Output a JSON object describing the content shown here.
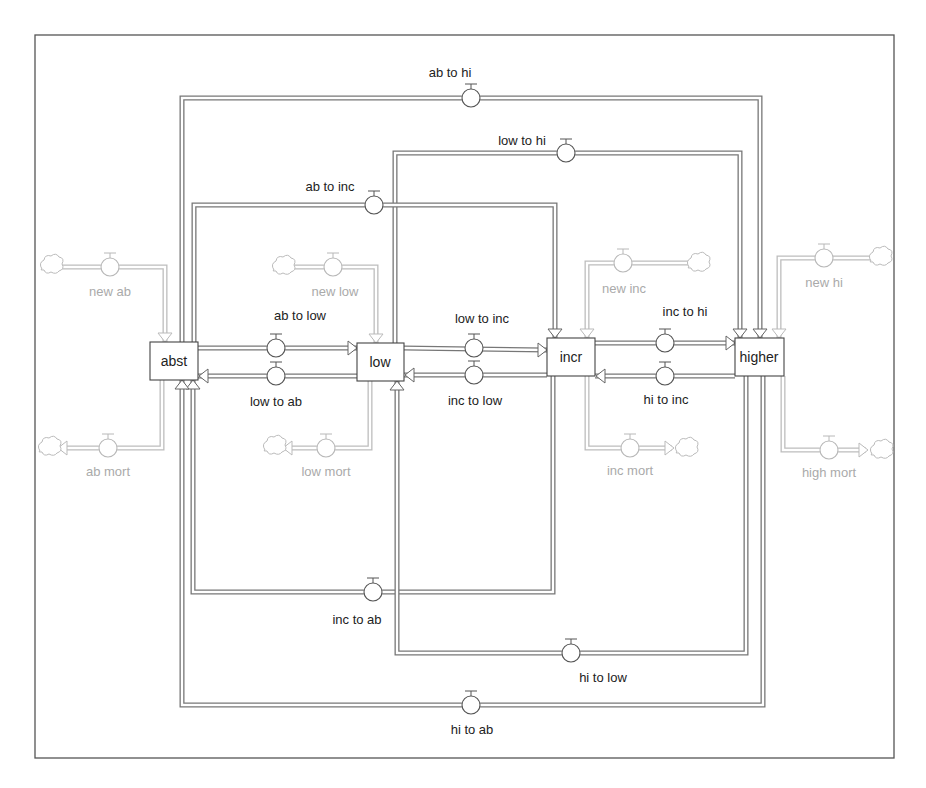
{
  "diagram": {
    "type": "stock-and-flow",
    "stocks": [
      {
        "id": "abst",
        "label": "abst"
      },
      {
        "id": "low",
        "label": "low"
      },
      {
        "id": "incr",
        "label": "incr"
      },
      {
        "id": "higher",
        "label": "higher"
      }
    ],
    "transfer_flows": [
      {
        "id": "ab_to_low",
        "label": "ab to low",
        "from": "abst",
        "to": "low"
      },
      {
        "id": "low_to_ab",
        "label": "low to ab",
        "from": "low",
        "to": "abst"
      },
      {
        "id": "low_to_inc",
        "label": "low to inc",
        "from": "low",
        "to": "incr"
      },
      {
        "id": "inc_to_low",
        "label": "inc to low",
        "from": "incr",
        "to": "low"
      },
      {
        "id": "inc_to_hi",
        "label": "inc to hi",
        "from": "incr",
        "to": "higher"
      },
      {
        "id": "hi_to_inc",
        "label": "hi to inc",
        "from": "higher",
        "to": "incr"
      },
      {
        "id": "ab_to_hi",
        "label": "ab to hi",
        "from": "abst",
        "to": "higher"
      },
      {
        "id": "low_to_hi",
        "label": "low to hi",
        "from": "low",
        "to": "higher"
      },
      {
        "id": "ab_to_inc",
        "label": "ab to inc",
        "from": "abst",
        "to": "incr"
      },
      {
        "id": "inc_to_ab",
        "label": "inc to ab",
        "from": "incr",
        "to": "abst"
      },
      {
        "id": "hi_to_low",
        "label": "hi to low",
        "from": "higher",
        "to": "low"
      },
      {
        "id": "hi_to_ab",
        "label": "hi to ab",
        "from": "higher",
        "to": "abst"
      }
    ],
    "external_flows": [
      {
        "id": "new_ab",
        "label": "new ab",
        "stock": "abst",
        "direction": "inflow"
      },
      {
        "id": "ab_mort",
        "label": "ab mort",
        "stock": "abst",
        "direction": "outflow"
      },
      {
        "id": "new_low",
        "label": "new low",
        "stock": "low",
        "direction": "inflow"
      },
      {
        "id": "low_mort",
        "label": "low mort",
        "stock": "low",
        "direction": "outflow"
      },
      {
        "id": "new_inc",
        "label": "new inc",
        "stock": "incr",
        "direction": "inflow"
      },
      {
        "id": "inc_mort",
        "label": "inc mort",
        "stock": "incr",
        "direction": "outflow"
      },
      {
        "id": "new_hi",
        "label": "new hi",
        "stock": "higher",
        "direction": "inflow"
      },
      {
        "id": "high_mort",
        "label": "high mort",
        "stock": "higher",
        "direction": "outflow"
      }
    ]
  }
}
